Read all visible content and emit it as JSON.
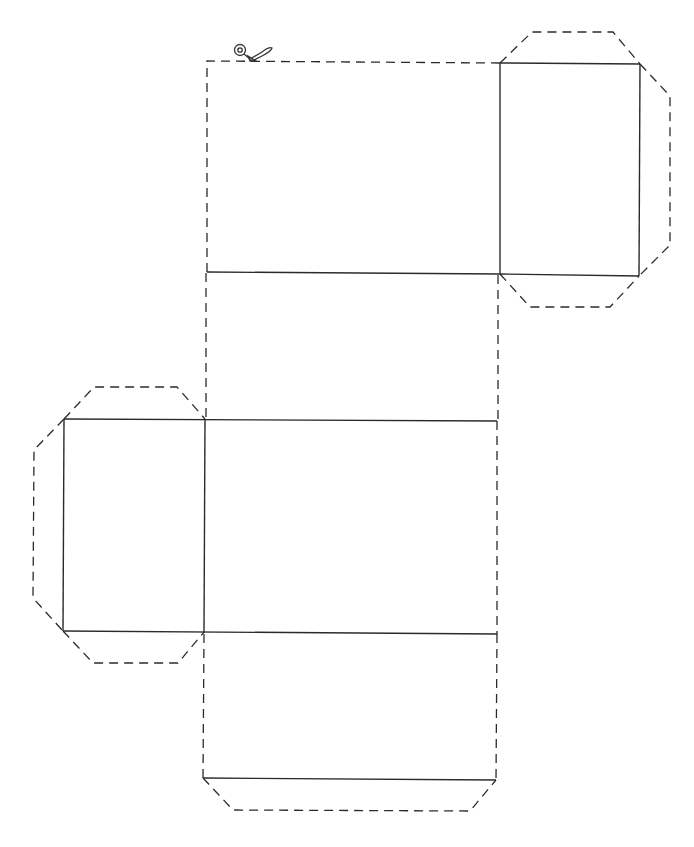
{
  "diagram": {
    "type": "box-net-template",
    "colors": {
      "line": "#2b2b2b",
      "background": "#ffffff"
    },
    "legend": {
      "solid": "fold line",
      "dashed": "cut line"
    },
    "icons": [
      "scissors-icon"
    ],
    "panels": [
      {
        "name": "top-panel",
        "x": 207,
        "y": 62,
        "w": 293,
        "h": 211
      },
      {
        "name": "right-end-square",
        "x": 500,
        "y": 63,
        "w": 140,
        "h": 212
      },
      {
        "name": "upper-middle-panel",
        "x": 206,
        "y": 273,
        "w": 292,
        "h": 147
      },
      {
        "name": "left-end-square",
        "x": 64,
        "y": 419,
        "w": 141,
        "h": 213
      },
      {
        "name": "lower-middle-panel",
        "x": 205,
        "y": 420,
        "w": 292,
        "h": 213
      },
      {
        "name": "bottom-panel",
        "x": 204,
        "y": 633,
        "w": 293,
        "h": 146
      }
    ],
    "footer_mark": ""
  }
}
